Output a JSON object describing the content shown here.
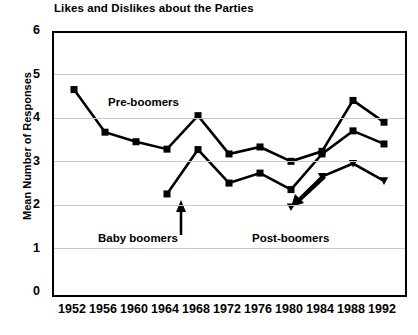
{
  "chart_data": {
    "type": "line",
    "title": "Likes and Dislikes about the Parties",
    "xlabel": "",
    "ylabel": "Mean Number of Responses",
    "ylim": [
      0,
      6
    ],
    "ytick_labels": [
      "0",
      "1",
      "2",
      "3",
      "4",
      "5",
      "6"
    ],
    "grid": true,
    "legend_position": "inline-annotations",
    "categories": [
      "1952",
      "1956",
      "1960",
      "1964",
      "1968",
      "1972",
      "1976",
      "1980",
      "1984",
      "1988",
      "1992"
    ],
    "series": [
      {
        "name": "Pre-boomers",
        "marker": "square",
        "values": [
          4.7,
          3.72,
          3.5,
          3.33,
          4.1,
          3.22,
          3.38,
          3.05,
          3.28,
          4.45,
          3.95
        ]
      },
      {
        "name": "Baby boomers",
        "marker": "square",
        "values": [
          null,
          null,
          null,
          2.3,
          3.32,
          2.55,
          2.78,
          2.4,
          3.22,
          3.75,
          3.45
        ]
      },
      {
        "name": "Post-boomers",
        "marker": "triangle",
        "values": [
          null,
          null,
          null,
          null,
          null,
          null,
          null,
          2.0,
          2.7,
          3.0,
          2.6
        ]
      }
    ],
    "annotations": [
      {
        "text": "Pre-boomers",
        "kind": "series-label"
      },
      {
        "text": "Baby boomers",
        "kind": "series-label-with-arrow"
      },
      {
        "text": "Post-boomers",
        "kind": "series-label-with-pointer"
      }
    ]
  }
}
